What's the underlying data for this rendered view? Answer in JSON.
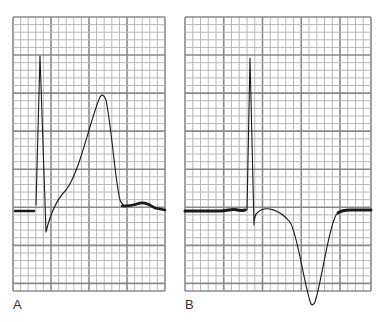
{
  "figure": {
    "colors": {
      "grid_minor": "#b8b8b8",
      "grid_major": "#8a8a8a",
      "trace": "#1a1a1a",
      "background": "#ffffff"
    }
  },
  "panels": [
    {
      "label": "A",
      "description": "Tall peaked (hyperacute) T wave following QRS complex",
      "grid": {
        "x0": 13,
        "y0": 17,
        "x1": 165,
        "y1": 291,
        "minor": 7.6,
        "major_every": 5
      },
      "baseline_path": "M15,211 L34,211 Q36,211 36,205",
      "trace_path": "M36,205 L40,56 L46,232 C50,215 56,200 66,190 C80,172 90,120 100,97 Q103,92 106,100 C112,130 115,180 120,200 C123,208 128,206 135,205 C142,203 146,202 152,206 C156,209 160,209 165,210",
      "thick_path": "M15,211 L34,211 M122,206 C128,206 135,205 140,203 C146,202 150,205 155,208 L165,210"
    },
    {
      "label": "B",
      "description": "Deep symmetric inverted T wave following QRS complex",
      "grid": {
        "x0": 185,
        "y0": 17,
        "x1": 371,
        "y1": 291,
        "minor": 7.6,
        "major_every": 5
      },
      "trace_path": "M185,211 L220,211 C228,211 232,208 238,210 Q243,212 245,210 L247,210 L250,58 L254,225 Q254,215 258,212 C266,205 280,210 290,222 C298,235 304,285 311,304 Q313,306 315,302 C322,280 328,230 336,215 Q340,210 348,210 L371,210",
      "thick_path": "M185,211 L220,211 C228,211 232,208 238,210 Q242,211 245,210 M338,213 Q342,210 350,210 L371,210"
    }
  ]
}
